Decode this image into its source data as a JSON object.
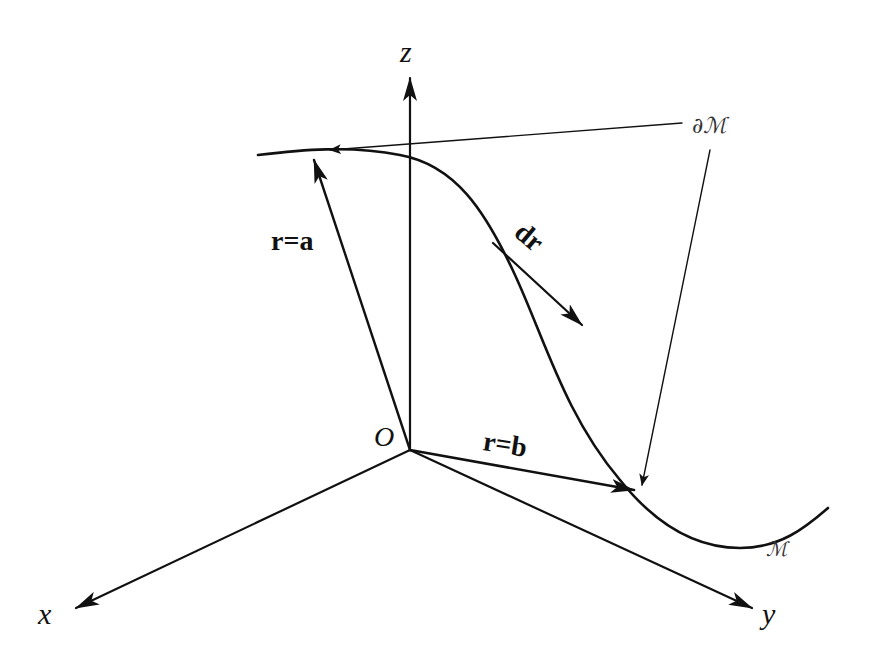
{
  "diagram": {
    "type": "3d-coordinate-diagram",
    "axes": {
      "z": {
        "label": "z"
      },
      "x": {
        "label": "x"
      },
      "y": {
        "label": "y"
      },
      "origin": {
        "label": "O"
      }
    },
    "vectors": {
      "r_a": {
        "label": "r=a"
      },
      "r_b": {
        "label": "r=b"
      },
      "dr": {
        "label": "dr"
      }
    },
    "curve": {
      "label": "ℳ"
    },
    "boundary": {
      "label": "∂ℳ"
    },
    "colors": {
      "ink": "#111111",
      "background": "#ffffff"
    }
  }
}
